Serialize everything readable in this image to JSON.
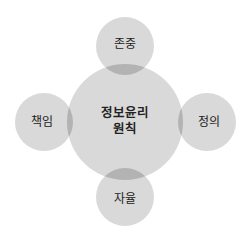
{
  "diagram": {
    "center": {
      "line1": "정보윤리",
      "line2": "원칙"
    },
    "satellites": {
      "top": "존중",
      "right": "정의",
      "bottom": "자율",
      "left": "책임"
    }
  },
  "colors": {
    "circle_fill": "#d4d4d4",
    "overlap_fill": "#b0b0b0",
    "text": "#222222",
    "background": "#ffffff"
  }
}
